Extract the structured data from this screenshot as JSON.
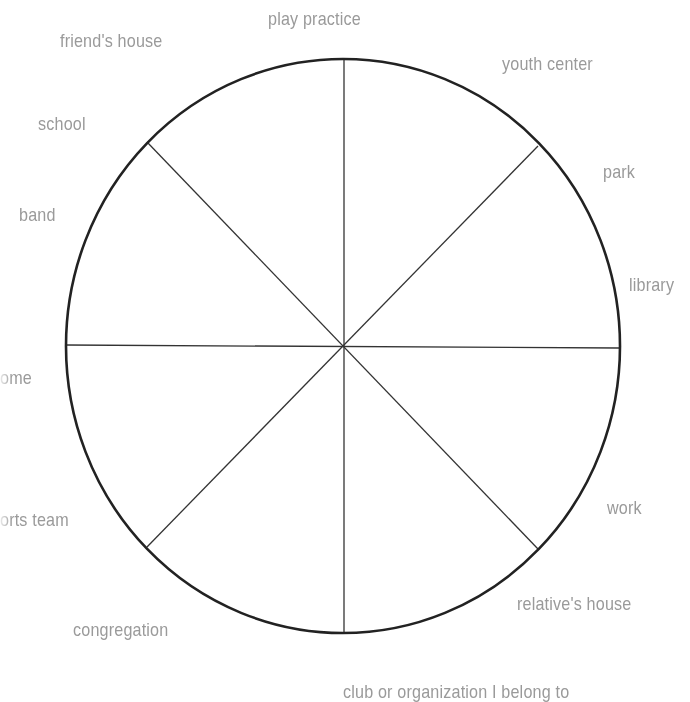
{
  "diagram": {
    "type": "circle-wheel",
    "segments": 8,
    "circle": {
      "cx": 343,
      "cy": 346,
      "rx": 277,
      "ry": 287,
      "stroke": "#222222"
    },
    "spoke_color": "#333333",
    "label_color": "#9a9a9a"
  },
  "labels": {
    "play_practice": "play practice",
    "friends_house": "friend's house",
    "youth_center": "youth center",
    "school": "school",
    "park": "park",
    "band": "band",
    "library": "library",
    "home": "ome",
    "sports_team": "orts team",
    "work": "work",
    "relatives_house": "relative's house",
    "congregation": "congregation",
    "club": "club or organization I belong to"
  }
}
